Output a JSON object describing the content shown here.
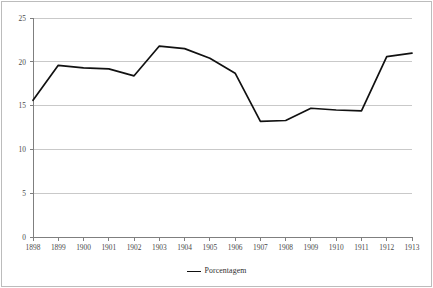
{
  "chart_data": {
    "type": "line",
    "title": "",
    "subtitle": "",
    "xlabel": "",
    "ylabel": "",
    "categories": [
      "1898",
      "1899",
      "1900",
      "1901",
      "1902",
      "1903",
      "1904",
      "1905",
      "1906",
      "1907",
      "1908",
      "1909",
      "1910",
      "1911",
      "1912",
      "1913"
    ],
    "series": [
      {
        "name": "Porcentagem",
        "color": "#111111",
        "values": [
          15.6,
          19.6,
          19.3,
          19.2,
          18.4,
          21.8,
          21.5,
          20.4,
          18.7,
          13.2,
          13.3,
          14.7,
          14.5,
          14.4,
          20.6,
          21.0
        ]
      }
    ],
    "ylim": [
      0,
      25
    ],
    "yticks": [
      0,
      5,
      10,
      15,
      20,
      25
    ],
    "ytick_labels": [
      "0",
      "5",
      "10",
      "15",
      "20",
      "25"
    ],
    "grid": {
      "horizontal": true,
      "vertical": false,
      "color": "#c9c9c9"
    },
    "legend": {
      "position": "bottom",
      "entries": [
        "Porcentagem"
      ]
    },
    "axis": {
      "line_color": "#7f7f7f",
      "tick_marks": true
    },
    "background": "#ffffff",
    "border_color": "#bcbcbc"
  }
}
